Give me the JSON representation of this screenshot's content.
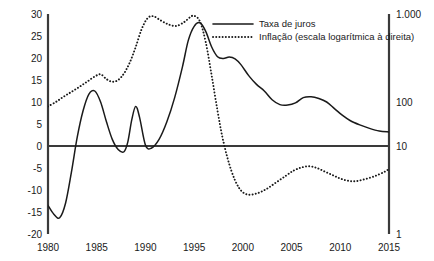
{
  "chart_data": {
    "type": "line",
    "title": "",
    "subtitle": "",
    "xlabel": "",
    "ylabel": "",
    "xlim": [
      1980,
      2015
    ],
    "ylim": [
      -20,
      30
    ],
    "grid": false,
    "legend_position": "top-right",
    "x_ticks": [
      "1980",
      "1985",
      "1990",
      "1995",
      "2000",
      "2005",
      "2010",
      "2015"
    ],
    "x_tick_values": [
      1980,
      1985,
      1990,
      1995,
      2000,
      2005,
      2010,
      2015
    ],
    "y_ticks_left": [
      "30",
      "25",
      "20",
      "15",
      "10",
      "5",
      "0",
      "-5",
      "-10",
      "-15",
      "-20"
    ],
    "y_tick_values_left": [
      30,
      25,
      20,
      15,
      10,
      5,
      0,
      -5,
      -10,
      -15,
      -20
    ],
    "right_axis": {
      "scale": "log",
      "ticks": [
        "1.000",
        "100",
        "10",
        "1"
      ],
      "tick_values": [
        1000,
        100,
        10,
        1
      ],
      "tick_left_equivalents": [
        30,
        10,
        0,
        -20
      ]
    },
    "zero_line": 0,
    "series": [
      {
        "name": "Taxa de juros",
        "style": "solid",
        "axis": "left",
        "color": "#1a1a1a",
        "x": [
          1980,
          1980.6,
          1981.2,
          1981.8,
          1982.4,
          1983.0,
          1983.6,
          1984.2,
          1984.8,
          1985.4,
          1986.0,
          1986.6,
          1987.2,
          1987.8,
          1988.2,
          1988.6,
          1989.0,
          1989.4,
          1990.0,
          1990.6,
          1991.4,
          1992.2,
          1993.0,
          1993.8,
          1994.4,
          1995.0,
          1995.6,
          1996.2,
          1996.8,
          1997.4,
          1998.0,
          1998.6,
          1999.2,
          1999.8,
          2000.6,
          2001.4,
          2002.2,
          2003.0,
          2003.8,
          2004.6,
          2005.4,
          2006.2,
          2007.0,
          2007.8,
          2008.6,
          2009.4,
          2010.2,
          2011.0,
          2012.0,
          2013.0,
          2014.0,
          2015.0
        ],
        "y": [
          -13.5,
          -15.5,
          -16.3,
          -13.0,
          -6.0,
          2.0,
          8.0,
          11.8,
          12.5,
          10.0,
          5.5,
          1.5,
          -0.8,
          -1.3,
          1.0,
          6.0,
          9.0,
          6.5,
          0.2,
          -0.5,
          1.5,
          5.5,
          11.0,
          18.0,
          24.0,
          27.2,
          28.0,
          26.0,
          22.5,
          20.3,
          19.9,
          20.2,
          19.8,
          18.5,
          16.0,
          14.0,
          12.5,
          10.5,
          9.4,
          9.3,
          9.8,
          11.0,
          11.2,
          10.8,
          10.0,
          8.5,
          7.0,
          5.8,
          4.8,
          4.0,
          3.4,
          3.2
        ]
      },
      {
        "name": "Inflação (escala logarítmica à direita)",
        "style": "dotted",
        "axis": "right",
        "color": "#1a1a1a",
        "x": [
          1980,
          1980.8,
          1981.6,
          1982.4,
          1983.2,
          1984.0,
          1984.8,
          1985.4,
          1986.0,
          1986.6,
          1987.2,
          1987.8,
          1988.4,
          1989.0,
          1989.6,
          1990.2,
          1990.8,
          1991.6,
          1992.4,
          1993.2,
          1994.0,
          1994.6,
          1995.0,
          1995.6,
          1996.2,
          1996.8,
          1997.4,
          1998.0,
          1998.8,
          1999.6,
          2000.4,
          2001.4,
          2002.4,
          2003.4,
          2004.4,
          2005.2,
          2006.0,
          2006.8,
          2007.6,
          2008.4,
          2009.2,
          2010.0,
          2010.8,
          2011.6,
          2012.6,
          2013.6,
          2014.6,
          2015.0
        ],
        "y": [
          9.0,
          10.0,
          11.2,
          12.3,
          13.4,
          14.6,
          15.8,
          16.3,
          15.2,
          14.6,
          15.0,
          16.5,
          19.0,
          22.5,
          26.5,
          29.0,
          29.5,
          28.5,
          27.6,
          27.3,
          28.2,
          29.3,
          29.6,
          28.3,
          23.5,
          16.0,
          8.0,
          1.0,
          -5.5,
          -9.5,
          -11.0,
          -10.8,
          -9.8,
          -8.3,
          -6.8,
          -5.6,
          -4.9,
          -4.6,
          -5.0,
          -5.8,
          -6.6,
          -7.4,
          -7.9,
          -8.0,
          -7.5,
          -6.8,
          -5.8,
          -5.2
        ],
        "y_equivalent_values_note": "plotted against right logarithmic axis"
      }
    ],
    "legend": [
      {
        "label": "Taxa de juros",
        "style": "solid"
      },
      {
        "label": "Inflação (escala logarítmica à direita)",
        "style": "dotted"
      }
    ]
  }
}
